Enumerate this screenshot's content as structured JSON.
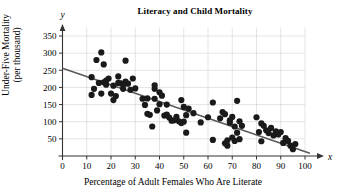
{
  "chart_data": {
    "type": "scatter",
    "title": "Literacy and Child Mortality",
    "xlabel": "Percentage of Adult Females Who Are Literate",
    "ylabel_line1": "Under-Five Mortality",
    "ylabel_line2": "(per thousand)",
    "x_axis_symbol": "x",
    "y_axis_symbol": "y",
    "xlim": [
      0,
      103
    ],
    "ylim": [
      0,
      375
    ],
    "xticks": [
      0,
      10,
      20,
      30,
      40,
      50,
      60,
      70,
      80,
      90,
      100
    ],
    "xticklabels": [
      "0",
      "10",
      "20",
      "30",
      "40",
      "50",
      "60",
      "70",
      "80",
      "90",
      "100"
    ],
    "yticks": [
      50,
      100,
      150,
      200,
      250,
      300,
      350
    ],
    "yticklabels": [
      "50",
      "100",
      "150",
      "200",
      "250",
      "300",
      "350"
    ],
    "grid": true,
    "grid_color": "#c8c8c8",
    "marker_color": "#1a1a1a",
    "marker_size": 3.1,
    "axis_color": "#333333",
    "trendline": {
      "shown": true,
      "color": "#5a5a5a",
      "x_start": 0,
      "y_start": 256,
      "x_end": 102,
      "y_end": 8
    },
    "points": [
      [
        12,
        230
      ],
      [
        12,
        178
      ],
      [
        13,
        196
      ],
      [
        14,
        280
      ],
      [
        15,
        213
      ],
      [
        16,
        302
      ],
      [
        16,
        182
      ],
      [
        17,
        267
      ],
      [
        17,
        215
      ],
      [
        18,
        220
      ],
      [
        18,
        208
      ],
      [
        19,
        226
      ],
      [
        20,
        182
      ],
      [
        21,
        205
      ],
      [
        21,
        163
      ],
      [
        22,
        175
      ],
      [
        23,
        232
      ],
      [
        23,
        213
      ],
      [
        24,
        212
      ],
      [
        25,
        208
      ],
      [
        25,
        196
      ],
      [
        26,
        278
      ],
      [
        26,
        217
      ],
      [
        27,
        211
      ],
      [
        28,
        193
      ],
      [
        29,
        226
      ],
      [
        30,
        197
      ],
      [
        33,
        167
      ],
      [
        34,
        149
      ],
      [
        35,
        168
      ],
      [
        35,
        123
      ],
      [
        36,
        120
      ],
      [
        37,
        86
      ],
      [
        38,
        206
      ],
      [
        38,
        196
      ],
      [
        38,
        167
      ],
      [
        39,
        133
      ],
      [
        40,
        186
      ],
      [
        40,
        151
      ],
      [
        41,
        176
      ],
      [
        42,
        118
      ],
      [
        43,
        150
      ],
      [
        43,
        121
      ],
      [
        44,
        112
      ],
      [
        45,
        103
      ],
      [
        46,
        104
      ],
      [
        47,
        114
      ],
      [
        48,
        101
      ],
      [
        49,
        163
      ],
      [
        49,
        96
      ],
      [
        50,
        143
      ],
      [
        50,
        100
      ],
      [
        51,
        119
      ],
      [
        51,
        68
      ],
      [
        52,
        138
      ],
      [
        54,
        125
      ],
      [
        57,
        98
      ],
      [
        60,
        113
      ],
      [
        62,
        156
      ],
      [
        62,
        47
      ],
      [
        65,
        110
      ],
      [
        66,
        128
      ],
      [
        67,
        122
      ],
      [
        67,
        37
      ],
      [
        68,
        30
      ],
      [
        68,
        46
      ],
      [
        69,
        104
      ],
      [
        69,
        97
      ],
      [
        70,
        114
      ],
      [
        70,
        54
      ],
      [
        71,
        86
      ],
      [
        71,
        44
      ],
      [
        72,
        161
      ],
      [
        72,
        68
      ],
      [
        73,
        101
      ],
      [
        73,
        49
      ],
      [
        74,
        88
      ],
      [
        80,
        113
      ],
      [
        81,
        70
      ],
      [
        82,
        95
      ],
      [
        82,
        43
      ],
      [
        83,
        88
      ],
      [
        84,
        75
      ],
      [
        85,
        67
      ],
      [
        86,
        82
      ],
      [
        87,
        60
      ],
      [
        88,
        72
      ],
      [
        89,
        63
      ],
      [
        90,
        70
      ],
      [
        91,
        38
      ],
      [
        92,
        52
      ],
      [
        93,
        44
      ],
      [
        94,
        30
      ],
      [
        95,
        20
      ],
      [
        96,
        35
      ]
    ]
  }
}
